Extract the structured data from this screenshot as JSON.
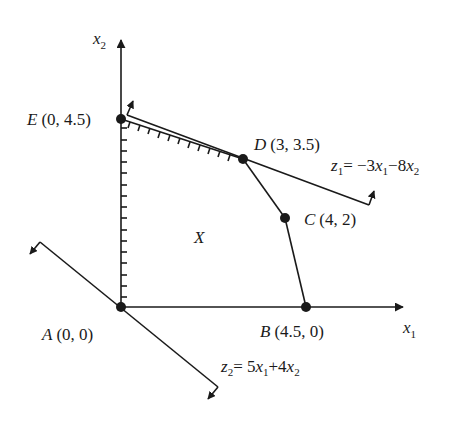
{
  "diagram": {
    "type": "linear-programming-feasible-region",
    "axes": {
      "x_label": "x",
      "x_sub": "1",
      "y_label": "x",
      "y_sub": "2"
    },
    "region_label": "X",
    "points": [
      {
        "id": "A",
        "name": "A",
        "coords": "(0, 0)",
        "x": 0,
        "y": 0
      },
      {
        "id": "B",
        "name": "B",
        "coords": "(4.5, 0)",
        "x": 4.5,
        "y": 0
      },
      {
        "id": "C",
        "name": "C",
        "coords": "(4, 2)",
        "x": 4,
        "y": 2
      },
      {
        "id": "D",
        "name": "D",
        "coords": "(3, 3.5)",
        "x": 3,
        "y": 3.5
      },
      {
        "id": "E",
        "name": "E",
        "coords": "(0, 4.5)",
        "x": 0,
        "y": 4.5
      }
    ],
    "objectives": {
      "z1": {
        "lhs": "z",
        "lhs_sub": "1",
        "eq": "= −3",
        "v1": "x",
        "v1_sub": "1",
        "mid": "−8",
        "v2": "x",
        "v2_sub": "2"
      },
      "z2": {
        "lhs": "z",
        "lhs_sub": "2",
        "eq": "= 5",
        "v1": "x",
        "v1_sub": "1",
        "mid": "+4",
        "v2": "x",
        "v2_sub": "2"
      }
    },
    "colors": {
      "line": "#1a1a1a",
      "background": "#ffffff"
    }
  }
}
